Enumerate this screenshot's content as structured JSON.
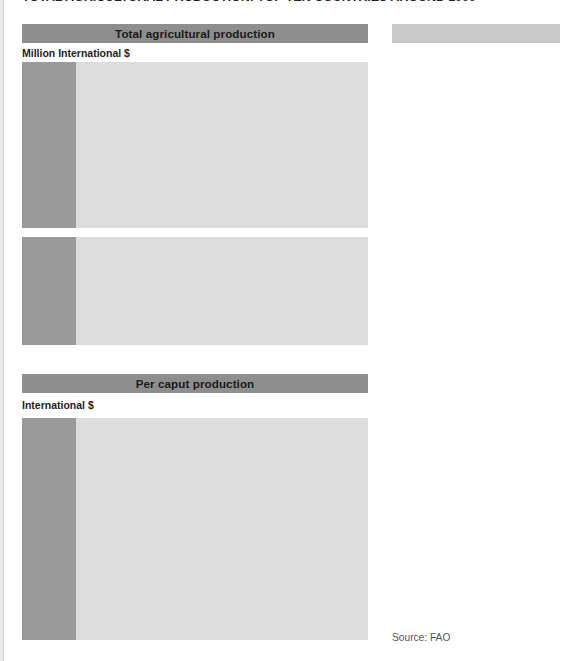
{
  "main_title": "TOTAL AGRICULTURAL PRODUCTION: TOP TEN COUNTRIES AROUND 1999",
  "source": "Source: FAO",
  "legend_header": "",
  "chart1": {
    "header": "Total agricultural production",
    "unit": "Million International $",
    "upper_ticks": [
      "600 000",
      "550 000",
      "500 000",
      "450 000",
      "400 000"
    ],
    "lower_ticks": [
      "100 000",
      "50 000",
      "0"
    ]
  },
  "chart2": {
    "header": "Per caput production",
    "unit": "International $",
    "ticks": [
      "1 000",
      "800",
      "600",
      "400",
      "200",
      "0"
    ]
  },
  "legend": {
    "items": [
      {
        "label": "World",
        "color": "#e8e8e8"
      },
      {
        "label": "United States",
        "color": "#a9a9a9"
      },
      {
        "label": "China",
        "color": "#bcbcbc"
      },
      {
        "label": "India",
        "color": "#cacaca"
      },
      {
        "label": "Russian Federation",
        "color": "#a3a3a3"
      },
      {
        "label": "France",
        "color": "#eeeeee"
      },
      {
        "label": "Germany",
        "color": "#c4c4c4"
      },
      {
        "label": "Argentina",
        "color": "#d6d6d6"
      },
      {
        "label": "Italy",
        "color": "#c0c0c0"
      },
      {
        "label": "Brazil",
        "color": "#e4e4e4"
      },
      {
        "label": "Ukraine",
        "color": "#9d9d9d"
      }
    ]
  },
  "chart_data": [
    {
      "type": "bar",
      "title": "Total agricultural production",
      "ylabel": "Million International $",
      "xlabel": "",
      "note": "Y axis is broken: upper panel 400 000-600 000, lower panel 0-100 000. Data labels show share of world production in percent.",
      "axis_break": true,
      "ylim_upper": [
        400000,
        600000
      ],
      "ylim_lower": [
        0,
        100000
      ],
      "grid": true,
      "categories": [
        "World",
        "United States",
        "China",
        "India",
        "Russian Federation",
        "France",
        "Germany",
        "Argentina",
        "Italy",
        "Brazil",
        "Ukraine"
      ],
      "values": [
        575000,
        97000,
        60000,
        36000,
        34000,
        25000,
        23000,
        17000,
        16000,
        15000,
        15000
      ],
      "data_labels": [
        "",
        "16.9 (% of world)",
        "10.4",
        "6.3",
        "6",
        "4.3",
        "4",
        "2.9",
        "2.8",
        "2.6",
        "2.6"
      ],
      "percent_of_world": [
        100,
        16.9,
        10.4,
        6.3,
        6,
        4.3,
        4,
        2.9,
        2.8,
        2.6,
        2.6
      ]
    },
    {
      "type": "bar",
      "title": "Per caput production",
      "ylabel": "International $",
      "xlabel": "",
      "ylim": [
        0,
        1000
      ],
      "grid": true,
      "categories": [
        "World",
        "United States",
        "China",
        "India",
        "Russian Federation",
        "France",
        "Germany",
        "Argentina",
        "Italy",
        "Brazil",
        "Ukraine"
      ],
      "values": [
        205,
        600,
        100,
        90,
        310,
        570,
        325,
        865,
        330,
        255,
        375
      ]
    }
  ]
}
